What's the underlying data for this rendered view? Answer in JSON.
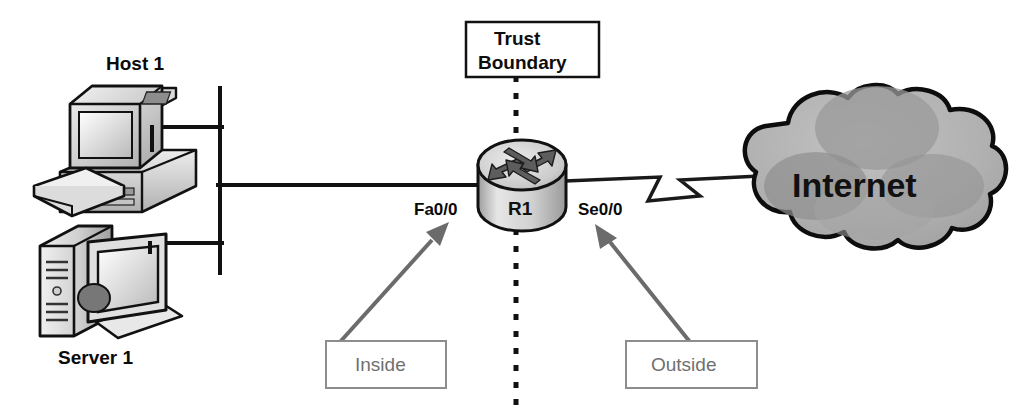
{
  "diagram": {
    "background_color": "#ffffff",
    "nodes": {
      "host": {
        "label": "Host 1",
        "icon": "desktop-computer-icon",
        "type": "workstation"
      },
      "server": {
        "label": "Server 1",
        "icon": "server-tower-icon",
        "type": "server"
      },
      "router": {
        "label": "R1",
        "icon": "router-icon",
        "type": "router",
        "interfaces": {
          "inside": "Fa0/0",
          "outside": "Se0/0"
        }
      },
      "cloud": {
        "label": "Internet",
        "icon": "cloud-icon",
        "type": "wan-cloud"
      }
    },
    "annotations": {
      "trust_boundary": {
        "line1": "Trust",
        "line2": "Boundary",
        "style": "dashed-vertical"
      },
      "inside_zone": {
        "label": "Inside"
      },
      "outside_zone": {
        "label": "Outside"
      }
    },
    "links": [
      {
        "from": "Host 1",
        "to": "LAN bus",
        "style": "ethernet"
      },
      {
        "from": "Server 1",
        "to": "LAN bus",
        "style": "ethernet"
      },
      {
        "from": "LAN bus",
        "to": "Fa0/0",
        "style": "ethernet"
      },
      {
        "from": "Se0/0",
        "to": "Internet",
        "style": "serial-lightning"
      }
    ],
    "colors": {
      "line": "#111111",
      "annotation_gray": "#6f6f6f",
      "cloud_fill": "#b4b4b4",
      "router_fill": "#c9c9c9"
    }
  }
}
